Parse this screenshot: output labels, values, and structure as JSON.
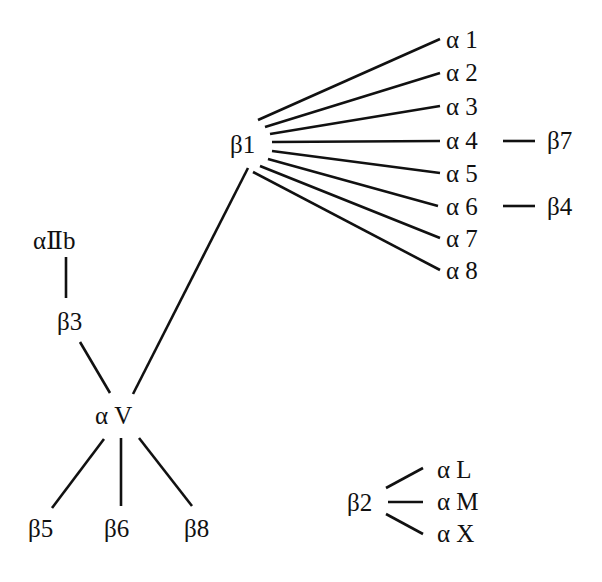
{
  "diagram": {
    "type": "integrin subunit association diagram",
    "nodes": {
      "b1": "β1",
      "a1": "α 1",
      "a2": "α 2",
      "a3": "α 3",
      "a4": "α 4",
      "a5": "α 5",
      "a6": "α 6",
      "a7": "α 7",
      "a8": "α 8",
      "b7": "β7",
      "b4": "β4",
      "aIIb": "αⅡb",
      "b3": "β3",
      "aV": "α V",
      "b5": "β5",
      "b6": "β6",
      "b8": "β8",
      "b2": "β2",
      "aL": "α L",
      "aM": "α M",
      "aX": "α X"
    },
    "edges": [
      [
        "b1",
        "a1"
      ],
      [
        "b1",
        "a2"
      ],
      [
        "b1",
        "a3"
      ],
      [
        "b1",
        "a4"
      ],
      [
        "b1",
        "a5"
      ],
      [
        "b1",
        "a6"
      ],
      [
        "b1",
        "a7"
      ],
      [
        "b1",
        "a8"
      ],
      [
        "a4",
        "b7"
      ],
      [
        "a6",
        "b4"
      ],
      [
        "b1",
        "aV"
      ],
      [
        "aIIb",
        "b3"
      ],
      [
        "b3",
        "aV"
      ],
      [
        "aV",
        "b5"
      ],
      [
        "aV",
        "b6"
      ],
      [
        "aV",
        "b8"
      ],
      [
        "b2",
        "aL"
      ],
      [
        "b2",
        "aM"
      ],
      [
        "b2",
        "aX"
      ]
    ],
    "colors": {
      "ink": "#111111",
      "background": "#ffffff"
    }
  }
}
